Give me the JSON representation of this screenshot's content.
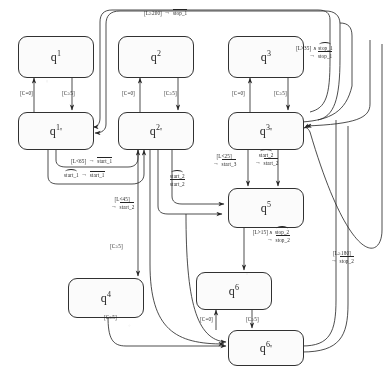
{
  "diagram": {
    "type": "state-machine",
    "states": [
      {
        "id": "q1",
        "label": "q",
        "sup": "1",
        "prime": "",
        "x": 18,
        "y": 36,
        "w": 74,
        "h": 40
      },
      {
        "id": "q2",
        "label": "q",
        "sup": "2",
        "prime": "",
        "x": 118,
        "y": 36,
        "w": 74,
        "h": 40
      },
      {
        "id": "q3",
        "label": "q",
        "sup": "3",
        "prime": "",
        "x": 228,
        "y": 36,
        "w": 74,
        "h": 40
      },
      {
        "id": "q1p",
        "label": "q",
        "sup": "1",
        "prime": "'",
        "x": 18,
        "y": 112,
        "w": 74,
        "h": 36
      },
      {
        "id": "q2p",
        "label": "q",
        "sup": "2",
        "prime": "'",
        "x": 118,
        "y": 112,
        "w": 74,
        "h": 36
      },
      {
        "id": "q3p",
        "label": "q",
        "sup": "3",
        "prime": "'",
        "x": 228,
        "y": 112,
        "w": 74,
        "h": 36
      },
      {
        "id": "q5",
        "label": "q",
        "sup": "5",
        "prime": "",
        "x": 228,
        "y": 188,
        "w": 74,
        "h": 38
      },
      {
        "id": "q4",
        "label": "q",
        "sup": "4",
        "prime": "",
        "x": 68,
        "y": 278,
        "w": 74,
        "h": 38
      },
      {
        "id": "q6",
        "label": "q",
        "sup": "6",
        "prime": "",
        "x": 196,
        "y": 272,
        "w": 74,
        "h": 36
      },
      {
        "id": "q6p",
        "label": "q",
        "sup": "6",
        "prime": "'",
        "x": 228,
        "y": 330,
        "w": 74,
        "h": 34
      }
    ],
    "guards": [
      {
        "id": "g-q1p-q1",
        "text": "[C=0]",
        "x": 20,
        "y": 90
      },
      {
        "id": "g-q1-q1p",
        "text": "[C≥5]",
        "x": 62,
        "y": 90
      },
      {
        "id": "g-q2p-q2",
        "text": "[C=0]",
        "x": 122,
        "y": 90
      },
      {
        "id": "g-q2-q2p",
        "text": "[C≥5]",
        "x": 164,
        "y": 90
      },
      {
        "id": "g-q3p-q3",
        "text": "[C=0]",
        "x": 232,
        "y": 90
      },
      {
        "id": "g-q3-q3p",
        "text": "[C≥5]",
        "x": 274,
        "y": 90
      },
      {
        "id": "g-q2p-q4",
        "text": "[C≥5]",
        "x": 110,
        "y": 243
      },
      {
        "id": "g-q4-q6p",
        "text": "[C≥5]",
        "x": 104,
        "y": 314
      },
      {
        "id": "g-q6p-q6",
        "text": "[C=0]",
        "x": 200,
        "y": 316
      },
      {
        "id": "g-q6-q6p",
        "text": "[C≥5]",
        "x": 246,
        "y": 316
      }
    ],
    "transitions": [
      {
        "id": "t-stop1-top",
        "guard": "[L≥200]",
        "event": "stop_1",
        "decor": "bar",
        "x": 144,
        "y": 9,
        "layout": "inline"
      },
      {
        "id": "t-stop1-right",
        "guard": "[L>35] ∧",
        "event": "stop_1",
        "decor": "tld",
        "out": "stop_1",
        "outdecor": "bar",
        "x": 296,
        "y": 46,
        "layout": "two-line"
      },
      {
        "id": "t-start1-a",
        "guard": "[L<65]",
        "event": "start_1",
        "decor": "bar",
        "x": 71,
        "y": 157,
        "layout": "inline"
      },
      {
        "id": "t-start1-b",
        "guard": "start_1",
        "gdecor": "tld",
        "event": "start_1",
        "decor": "bar",
        "x": 64,
        "y": 171,
        "layout": "inline"
      },
      {
        "id": "t-start3",
        "guard": "[L<25]",
        "event": "start_3",
        "decor": "bar",
        "x": 212,
        "y": 155,
        "layout": "two-line-left"
      },
      {
        "id": "t-start2-q3p",
        "guard": "start_2",
        "gdecor": "tld",
        "event": "start_2",
        "decor": "bar",
        "x": 254,
        "y": 153,
        "layout": "two-line-left"
      },
      {
        "id": "t-start2-q5",
        "guard": "start_2",
        "gdecor": "tld",
        "event": "start_2",
        "decor": "bar",
        "x": 170,
        "y": 174,
        "layout": "two-line-left"
      },
      {
        "id": "t-start2-q4",
        "guard": "[L<45]",
        "event": "start_2",
        "decor": "bar",
        "x": 110,
        "y": 198,
        "layout": "two-line-left"
      },
      {
        "id": "t-stop2-q5",
        "guard": "[L>15] ∧",
        "event": "stop_2",
        "decor": "tld",
        "out": "stop_2",
        "outdecor": "bar",
        "x": 252,
        "y": 230,
        "layout": "two-line"
      },
      {
        "id": "t-stop2-far",
        "guard": "[L≥180]",
        "event": "stop_2",
        "decor": "bar",
        "x": 330,
        "y": 252,
        "layout": "two-line-left"
      }
    ],
    "symbols": {
      "arrow": "→",
      "and": "∧"
    }
  }
}
